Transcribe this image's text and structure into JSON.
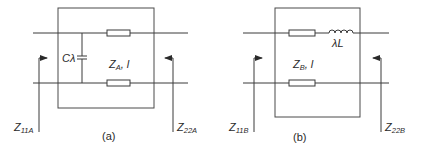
{
  "figure": {
    "panel_a": {
      "caption": "(a)",
      "capacitor_label": "Cλ",
      "line_label_main": "Z",
      "line_label_sub": "A",
      "line_label_rest": ", l",
      "left_port_main": "Z",
      "left_port_sub": "11A",
      "right_port_main": "Z",
      "right_port_sub": "22A"
    },
    "panel_b": {
      "caption": "(b)",
      "inductor_label": "λL",
      "line_label_main": "Z",
      "line_label_sub": "B",
      "line_label_rest": ", l",
      "left_port_main": "Z",
      "left_port_sub": "11B",
      "right_port_main": "Z",
      "right_port_sub": "22B"
    },
    "colors": {
      "stroke": "#3a3a3a",
      "background": "#ffffff"
    }
  }
}
